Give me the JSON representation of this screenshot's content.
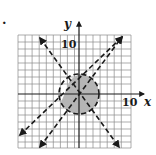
{
  "problem": {
    "number_label": "."
  },
  "graph": {
    "x_axis_label": "x",
    "y_axis_label": "y",
    "x_tick_label": "10",
    "y_tick_label": "10",
    "grid": {
      "cols": 16,
      "rows": 16
    },
    "colors": {
      "ink": "#1a1a1a",
      "grid": "#8a8a8a",
      "shade": "#b5b5b5"
    },
    "elements": [
      {
        "type": "dashed-circle",
        "boundary": "dashed"
      },
      {
        "type": "dashed-line",
        "direction": "negative-slope",
        "boundary": "dashed"
      },
      {
        "type": "dashed-line",
        "direction": "positive-slope-shallow",
        "boundary": "dashed"
      },
      {
        "type": "dashed-line",
        "direction": "positive-slope-steep",
        "boundary": "dashed"
      },
      {
        "type": "shaded-region",
        "description": "inside circle, right of steep line, below shallow line"
      }
    ]
  }
}
